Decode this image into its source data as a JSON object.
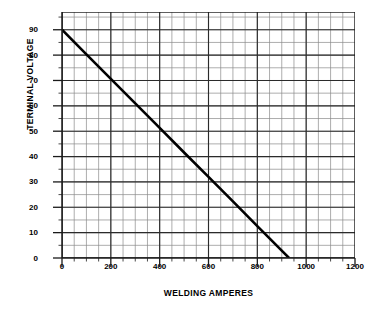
{
  "chart_data": {
    "type": "line",
    "title": "",
    "subtitle": "",
    "xlabel": "WELDING AMPERES",
    "ylabel": "TERMINAL VOLTAGE",
    "xlim": [
      0,
      1200
    ],
    "ylim": [
      0,
      97
    ],
    "xticks": [
      0,
      200,
      400,
      600,
      800,
      1000,
      1200
    ],
    "xtick_labels": [
      "0",
      "200",
      "400",
      "600",
      "800",
      "1000",
      "1200"
    ],
    "yticks": [
      0,
      10,
      20,
      30,
      40,
      50,
      60,
      70,
      80,
      90
    ],
    "ytick_labels": [
      "0",
      "10",
      "20",
      "30",
      "40",
      "50",
      "60",
      "70",
      "80",
      "90"
    ],
    "grid": true,
    "grid_minor_x_step": 50,
    "grid_minor_y_step": 5,
    "grid_major_x_step": 200,
    "grid_major_y_step": 10,
    "legend": null,
    "legend_position": "none",
    "series": [
      {
        "name": "Drooping volt-ampere characteristic",
        "color": "#000000",
        "linewidth": 2.6,
        "x": [
          0,
          100,
          200,
          300,
          400,
          500,
          600,
          700,
          800,
          900,
          930
        ],
        "y": [
          90,
          80.3,
          70.6,
          61.0,
          51.3,
          41.6,
          32.0,
          22.3,
          12.6,
          2.9,
          0
        ]
      }
    ],
    "annotations": []
  },
  "colors": {
    "background": "#ffffff",
    "axis": "#1a1a1a",
    "grid_minor": "#8a8a8a",
    "grid_major": "#2b2b2b",
    "curve": "#000000",
    "text": "#000000"
  }
}
